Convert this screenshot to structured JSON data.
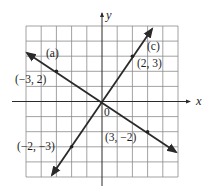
{
  "chart_data": {
    "type": "line",
    "title": "",
    "xlabel": "x",
    "ylabel": "y",
    "xlim": [
      -5,
      5
    ],
    "ylim": [
      -5,
      5
    ],
    "grid": true,
    "grid_step": 1,
    "origin_label": "0",
    "series": [
      {
        "name": "(a)",
        "equation": "y = -2/3 x",
        "slope": -0.6667,
        "intercept": 0,
        "x_range": [
          -4.93,
          4.87
        ],
        "points": [
          {
            "x": -3,
            "y": 2,
            "label": "(−3, 2)"
          },
          {
            "x": 3,
            "y": -2,
            "label": "(3, −2)"
          }
        ]
      },
      {
        "name": "(c)",
        "equation": "y = 3/2 x",
        "slope": 1.5,
        "intercept": 0,
        "x_range": [
          -3.29,
          3.29
        ],
        "points": [
          {
            "x": 2,
            "y": 3,
            "label": "(2, 3)"
          },
          {
            "x": -2,
            "y": -3,
            "label": "(−2, −3)"
          }
        ]
      }
    ],
    "annotations": [
      {
        "text": "(a)",
        "near_series": "(a)"
      },
      {
        "text": "(c)",
        "near_series": "(c)"
      }
    ]
  },
  "labels": {
    "x_axis": "x",
    "y_axis": "y",
    "origin": "0",
    "line_a": "(a)",
    "line_c": "(c)",
    "pt_m3_2": "(−3, 2)",
    "pt_3_m2": "(3, −2)",
    "pt_2_3": "(2, 3)",
    "pt_m2_m3": "(−2, −3)"
  },
  "colors": {
    "background": "#ffffff",
    "grid": "#8a8a8a",
    "line": "#2a2a2a"
  }
}
